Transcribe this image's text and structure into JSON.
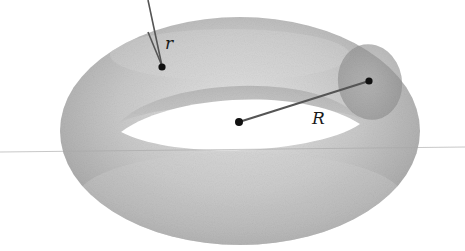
{
  "diagram": {
    "labels": {
      "minor_radius": "r",
      "major_radius": "R"
    },
    "colors": {
      "background": "#ffffff",
      "torus_mid": "#b9b9b9",
      "torus_dark": "#8f8f8f",
      "torus_light": "#e4e4e4",
      "tube_section": "#9a9a9a",
      "line": "#555555",
      "point": "#111111",
      "guide_line": "#a8a8a8"
    }
  }
}
